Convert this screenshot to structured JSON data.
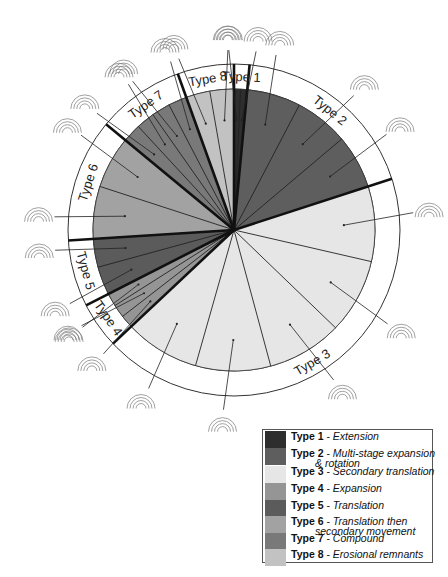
{
  "chart_data": {
    "type": "pie",
    "title": "",
    "ring_labels": [
      "Type 1",
      "Type 2",
      "Type 3",
      "Type 4",
      "Type 5",
      "Type 6",
      "Type 7",
      "Type 8"
    ],
    "slices": [
      {
        "name": "Type 1",
        "description": "Extension",
        "percent": 1.5,
        "color": "#2e2e2e",
        "subdivisions": 2
      },
      {
        "name": "Type 2",
        "description": "Multi-stage expansion & rotation",
        "percent": 18.5,
        "color": "#5e5e5e",
        "subdivisions": 3
      },
      {
        "name": "Type 3",
        "description": "Secondary translation",
        "percent": 43.0,
        "color": "#e6e6e6",
        "subdivisions": 5
      },
      {
        "name": "Type 4",
        "description": "Expansion",
        "percent": 4.5,
        "color": "#959595",
        "subdivisions": 3
      },
      {
        "name": "Type 5",
        "description": "Translation",
        "percent": 6.5,
        "color": "#5b5b5b",
        "subdivisions": 2
      },
      {
        "name": "Type 6",
        "description": "Translation then secondary movement",
        "percent": 12.0,
        "color": "#a2a2a2",
        "subdivisions": 2
      },
      {
        "name": "Type 7",
        "description": "Compound",
        "percent": 8.5,
        "color": "#797979",
        "subdivisions": 4
      },
      {
        "name": "Type 8",
        "description": "Erosional remnants",
        "percent": 5.5,
        "color": "#c2c2c2",
        "subdivisions": 2
      }
    ],
    "legend": {
      "placement": "bottom-right",
      "entries": [
        {
          "type": "Type 1",
          "sep": " - ",
          "desc": "Extension",
          "desc2": ""
        },
        {
          "type": "Type 2",
          "sep": " - ",
          "desc": "Multi-stage expansion",
          "desc2": "& rotation"
        },
        {
          "type": "Type 3",
          "sep": " - ",
          "desc": "Secondary translation",
          "desc2": ""
        },
        {
          "type": "Type 4",
          "sep": " - ",
          "desc": "Expansion",
          "desc2": ""
        },
        {
          "type": "Type 5",
          "sep": " - ",
          "desc": "Translation",
          "desc2": ""
        },
        {
          "type": "Type 6",
          "sep": " - ",
          "desc": "Translation then",
          "desc2": "secondary movement"
        },
        {
          "type": "Type 7",
          "sep": " - ",
          "desc": "Compound",
          "desc2": ""
        },
        {
          "type": "Type 8",
          "sep": " - ",
          "desc": "Erosional remnants",
          "desc2": ""
        }
      ]
    }
  }
}
